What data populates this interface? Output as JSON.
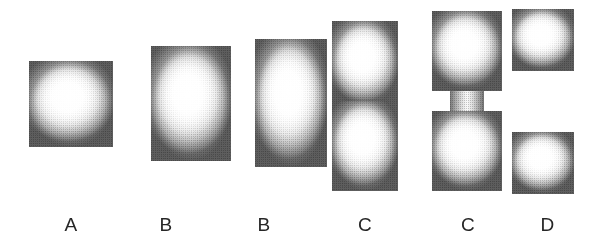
{
  "figure": {
    "background_color": "#ffffff",
    "ink_color": "#262626",
    "width": 601,
    "height": 248
  },
  "stages": [
    {
      "label": "A",
      "shape_name": "sphere",
      "description": "Single round cell, undivided"
    },
    {
      "label": "B",
      "shape_name": "vertical-ellipse",
      "description": "Cell elongating into an oval"
    },
    {
      "label": "B",
      "shape_name": "capsule-rod",
      "description": "Cell fully elongated into a rod / capsule"
    },
    {
      "label": "C",
      "shape_name": "constricting-peanut",
      "description": "Cell constricting at the midline, peanut shaped"
    },
    {
      "label": "C",
      "shape_name": "hourglass-pinch",
      "description": "Deep constriction, narrow hourglass neck"
    },
    {
      "label": "D",
      "shape_name": "two-daughter-spheres",
      "description": "Two separated daughter cells"
    }
  ]
}
